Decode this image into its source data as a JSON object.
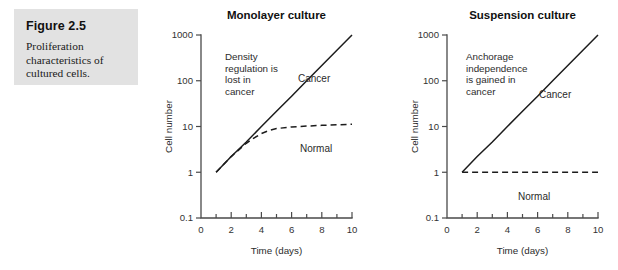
{
  "caption": {
    "title": "Figure 2.5",
    "body": "Proliferation characteristics of cultured cells."
  },
  "chart_data": [
    {
      "type": "line",
      "id": "monolayer",
      "title": "Monolayer culture",
      "xlabel": "Time (days)",
      "ylabel": "Cell number",
      "xlim": [
        0,
        10
      ],
      "ylim": [
        0.1,
        1000
      ],
      "yscale": "log",
      "grid": false,
      "legend": "inline-labels",
      "xticks": [
        0,
        1,
        2,
        3,
        4,
        5,
        6,
        7,
        8,
        9,
        10
      ],
      "xticklabels": [
        "0",
        "",
        "2",
        "",
        "4",
        "",
        "6",
        "",
        "8",
        "",
        "10"
      ],
      "yticks": [
        0.1,
        1,
        10,
        100,
        1000
      ],
      "yticklabels": [
        "0.1",
        "1",
        "10",
        "100",
        "1000"
      ],
      "annotation": "Density regulation is lost in cancer",
      "series": [
        {
          "name": "Cancer",
          "style": "solid",
          "x": [
            1,
            2,
            3,
            4,
            5,
            6,
            7,
            8,
            9,
            10
          ],
          "values": [
            1,
            2.2,
            4.6,
            10,
            21.5,
            46,
            100,
            215,
            464,
            1000
          ]
        },
        {
          "name": "Normal",
          "style": "dashed",
          "x": [
            1,
            2,
            3,
            3.5,
            4,
            4.5,
            5,
            6,
            7,
            8,
            9,
            10
          ],
          "values": [
            1,
            2.2,
            4.3,
            5.6,
            7.0,
            8.2,
            9.0,
            9.8,
            10.2,
            10.6,
            10.9,
            11.2
          ]
        }
      ]
    },
    {
      "type": "line",
      "id": "suspension",
      "title": "Suspension culture",
      "xlabel": "Time (days)",
      "ylabel": "Cell number",
      "xlim": [
        0,
        10
      ],
      "ylim": [
        0.1,
        1000
      ],
      "yscale": "log",
      "grid": false,
      "legend": "inline-labels",
      "xticks": [
        0,
        1,
        2,
        3,
        4,
        5,
        6,
        7,
        8,
        9,
        10
      ],
      "xticklabels": [
        "0",
        "",
        "2",
        "",
        "4",
        "",
        "6",
        "",
        "8",
        "",
        "10"
      ],
      "yticks": [
        0.1,
        1,
        10,
        100,
        1000
      ],
      "yticklabels": [
        "0.1",
        "1",
        "10",
        "100",
        "1000"
      ],
      "annotation": "Anchorage independence is gained in cancer",
      "series": [
        {
          "name": "Cancer",
          "style": "solid",
          "x": [
            1,
            2,
            3,
            4,
            5,
            6,
            7,
            8,
            9,
            10
          ],
          "values": [
            1,
            2.2,
            4.6,
            10,
            21.5,
            46,
            100,
            215,
            464,
            1000
          ]
        },
        {
          "name": "Normal",
          "style": "dashed",
          "x": [
            1,
            2,
            3,
            4,
            5,
            6,
            7,
            8,
            9,
            10
          ],
          "values": [
            1,
            1,
            1,
            1,
            1,
            1,
            1,
            1,
            1,
            1
          ]
        }
      ]
    }
  ],
  "colors": {
    "panel_background": "#e2e2e2",
    "page_background": "#ffffff",
    "axis": "#4a4a4a",
    "curve": "#1c1c1c",
    "text": "#2b2b2b"
  }
}
